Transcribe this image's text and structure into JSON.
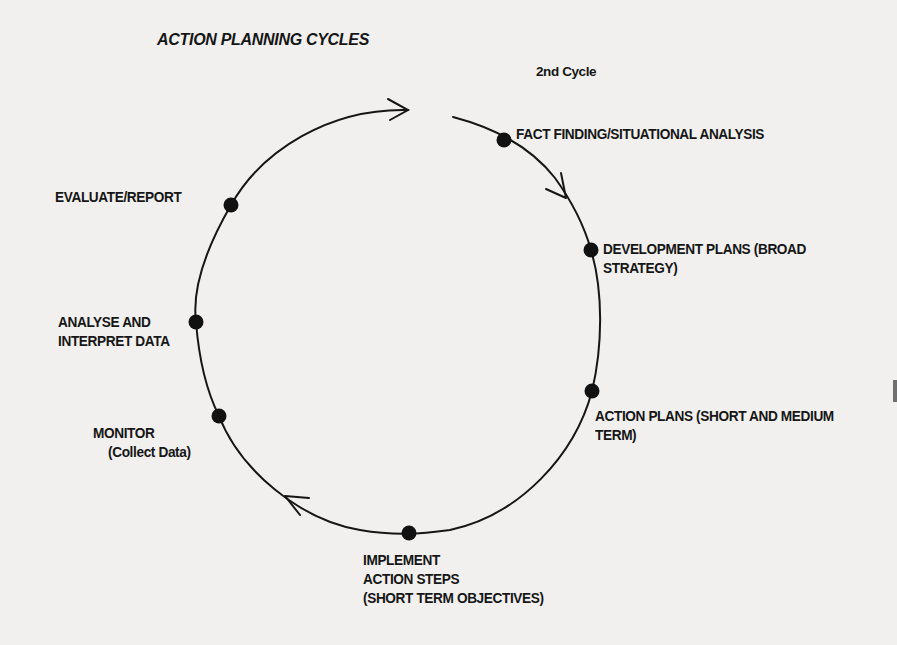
{
  "diagram": {
    "title": "ACTION PLANNING CYCLES",
    "cycle_label": "2nd Cycle",
    "stages": [
      {
        "id": "fact-finding",
        "lines": [
          "FACT FINDING/SITUATIONAL ANALYSIS"
        ]
      },
      {
        "id": "development-plans",
        "lines": [
          "DEVELOPMENT PLANS (BROAD",
          "STRATEGY)"
        ]
      },
      {
        "id": "action-plans",
        "lines": [
          "ACTION PLANS (SHORT AND MEDIUM",
          "TERM)"
        ]
      },
      {
        "id": "implement",
        "lines": [
          "IMPLEMENT",
          "ACTION STEPS",
          "(SHORT TERM OBJECTIVES)"
        ]
      },
      {
        "id": "monitor",
        "lines": [
          "MONITOR",
          "(Collect Data)"
        ]
      },
      {
        "id": "analyse",
        "lines": [
          "ANALYSE AND",
          "INTERPRET DATA"
        ]
      },
      {
        "id": "evaluate",
        "lines": [
          "EVALUATE/REPORT"
        ]
      }
    ],
    "flow_direction": "clockwise",
    "colors": {
      "ink": "#161616",
      "paper": "#f1f0ee"
    }
  }
}
